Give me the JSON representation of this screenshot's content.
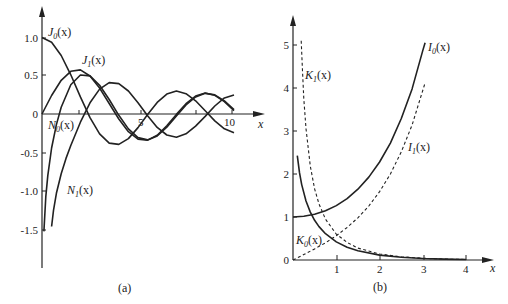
{
  "chart_data": [
    {
      "panel": "a",
      "type": "line",
      "caption": "(a)",
      "title": "",
      "xlabel": "x",
      "ylabel": "",
      "xlim": [
        0,
        10.5
      ],
      "ylim": [
        -1.7,
        1.2
      ],
      "x_ticks": [
        5,
        10
      ],
      "x_tick_labels": [
        "5",
        "10"
      ],
      "y_ticks": [
        1.0,
        0.5,
        0,
        -0.5,
        -1.0,
        -1.5
      ],
      "y_tick_labels": [
        "1.0",
        "0.5",
        "0",
        "-0.5",
        "-1.0",
        "-1.5"
      ],
      "grid": false,
      "legend": "inline labels",
      "series": [
        {
          "name": "J0(x)",
          "label_main": "J",
          "label_sub": "0",
          "style": "solid",
          "x": [
            0,
            0.5,
            1,
            1.5,
            2,
            2.5,
            3,
            3.5,
            4,
            4.5,
            5,
            5.5,
            6,
            6.5,
            7,
            7.5,
            8,
            8.5,
            9,
            9.5,
            10
          ],
          "values": [
            1.0,
            0.938,
            0.765,
            0.512,
            0.224,
            -0.048,
            -0.26,
            -0.38,
            -0.397,
            -0.321,
            -0.178,
            -0.007,
            0.151,
            0.26,
            0.3,
            0.266,
            0.172,
            0.042,
            -0.09,
            -0.194,
            -0.246
          ]
        },
        {
          "name": "J1(x)",
          "label_main": "J",
          "label_sub": "1",
          "style": "solid",
          "x": [
            0,
            0.5,
            1,
            1.5,
            2,
            2.5,
            3,
            3.5,
            4,
            4.5,
            5,
            5.5,
            6,
            6.5,
            7,
            7.5,
            8,
            8.5,
            9,
            9.5,
            10
          ],
          "values": [
            0,
            0.242,
            0.44,
            0.558,
            0.577,
            0.497,
            0.339,
            0.137,
            -0.066,
            -0.231,
            -0.328,
            -0.341,
            -0.277,
            -0.154,
            -0.005,
            0.135,
            0.235,
            0.273,
            0.245,
            0.161,
            0.043
          ]
        },
        {
          "name": "N0(x)",
          "label_main": "N",
          "label_sub": "0",
          "style": "solid",
          "x": [
            0.1,
            0.2,
            0.3,
            0.5,
            0.75,
            1,
            1.5,
            2,
            2.5,
            3,
            3.5,
            4,
            4.5,
            5,
            5.5,
            6,
            6.5,
            7,
            7.5,
            8,
            8.5,
            9,
            9.5,
            10
          ],
          "values": [
            -1.534,
            -1.081,
            -0.807,
            -0.445,
            -0.138,
            0.088,
            0.382,
            0.51,
            0.498,
            0.377,
            0.189,
            -0.017,
            -0.195,
            -0.309,
            -0.339,
            -0.288,
            -0.173,
            -0.026,
            0.117,
            0.224,
            0.27,
            0.25,
            0.171,
            0.056
          ]
        },
        {
          "name": "N1(x)",
          "label_main": "N",
          "label_sub": "1",
          "style": "solid",
          "x": [
            0.5,
            0.6,
            0.75,
            1,
            1.25,
            1.5,
            2,
            2.5,
            3,
            3.5,
            4,
            4.5,
            5,
            5.5,
            6,
            6.5,
            7,
            7.5,
            8,
            8.5,
            9,
            9.5,
            10
          ],
          "values": [
            -1.471,
            -1.26,
            -1.037,
            -0.781,
            -0.58,
            -0.412,
            -0.107,
            0.146,
            0.325,
            0.41,
            0.398,
            0.301,
            0.148,
            -0.024,
            -0.175,
            -0.274,
            -0.303,
            -0.259,
            -0.158,
            -0.032,
            0.104,
            0.21,
            0.249
          ]
        }
      ]
    },
    {
      "panel": "b",
      "type": "line",
      "caption": "(b)",
      "title": "",
      "xlabel": "x",
      "ylabel": "",
      "xlim": [
        0,
        4.4
      ],
      "ylim": [
        0,
        5.3
      ],
      "x_ticks": [
        1,
        2,
        3,
        4
      ],
      "x_tick_labels": [
        "1",
        "2",
        "3",
        "4"
      ],
      "y_ticks": [
        0,
        1,
        2,
        3,
        4,
        5
      ],
      "y_tick_labels": [
        "0",
        "1",
        "2",
        "3",
        "4",
        "5"
      ],
      "grid": false,
      "legend": "inline labels",
      "series": [
        {
          "name": "I0(x)",
          "label_main": "I",
          "label_sub": "0",
          "style": "solid",
          "x": [
            0,
            0.25,
            0.5,
            0.75,
            1,
            1.25,
            1.5,
            1.75,
            2,
            2.25,
            2.5,
            2.75,
            3,
            3.05
          ],
          "values": [
            1.0,
            1.016,
            1.063,
            1.146,
            1.266,
            1.429,
            1.647,
            1.928,
            2.28,
            2.718,
            3.29,
            3.98,
            4.881,
            5.05
          ]
        },
        {
          "name": "I1(x)",
          "label_main": "I",
          "label_sub": "1",
          "style": "dashed",
          "x": [
            0,
            0.25,
            0.5,
            0.75,
            1,
            1.25,
            1.5,
            1.75,
            2,
            2.25,
            2.5,
            2.75,
            3,
            3.05
          ],
          "values": [
            0,
            0.126,
            0.258,
            0.401,
            0.565,
            0.755,
            0.982,
            1.256,
            1.591,
            2.0,
            2.517,
            3.14,
            3.953,
            4.12
          ]
        },
        {
          "name": "K0(x)",
          "label_main": "K",
          "label_sub": "0",
          "style": "solid",
          "x": [
            0.1,
            0.15,
            0.2,
            0.3,
            0.4,
            0.5,
            0.6,
            0.75,
            1,
            1.25,
            1.5,
            2,
            2.5,
            3,
            3.5,
            4
          ],
          "values": [
            2.427,
            2.03,
            1.753,
            1.372,
            1.115,
            0.924,
            0.777,
            0.611,
            0.421,
            0.296,
            0.214,
            0.114,
            0.062,
            0.035,
            0.02,
            0.011
          ]
        },
        {
          "name": "K1(x)",
          "label_main": "K",
          "label_sub": "1",
          "style": "dashed",
          "x": [
            0.19,
            0.22,
            0.25,
            0.3,
            0.4,
            0.5,
            0.6,
            0.75,
            1,
            1.25,
            1.5,
            2,
            2.5,
            3,
            3.5,
            4
          ],
          "values": [
            5.1,
            4.4,
            3.75,
            3.056,
            2.184,
            1.656,
            1.303,
            0.949,
            0.602,
            0.41,
            0.277,
            0.14,
            0.074,
            0.04,
            0.022,
            0.012
          ]
        }
      ]
    }
  ],
  "panel_a": {
    "caption": "(a)",
    "x_axis_label": "x",
    "x_ticks": [
      "5",
      "10"
    ],
    "y_ticks": [
      "1.0",
      "0.5",
      "0",
      "-0.5",
      "-1.0",
      "-1.5"
    ],
    "labels": {
      "J0": {
        "main": "J",
        "sub": "0",
        "arg": "(x)"
      },
      "J1": {
        "main": "J",
        "sub": "1",
        "arg": "(x)"
      },
      "N0": {
        "main": "N",
        "sub": "0",
        "arg": "(x)"
      },
      "N1": {
        "main": "N",
        "sub": "1",
        "arg": "(x)"
      }
    }
  },
  "panel_b": {
    "caption": "(b)",
    "x_axis_label": "x",
    "x_ticks": [
      "1",
      "2",
      "3",
      "4"
    ],
    "y_ticks": [
      "0",
      "1",
      "2",
      "3",
      "4",
      "5"
    ],
    "labels": {
      "I0": {
        "main": "I",
        "sub": "0",
        "arg": "(x)"
      },
      "I1": {
        "main": "I",
        "sub": "1",
        "arg": "(x)"
      },
      "K0": {
        "main": "K",
        "sub": "0",
        "arg": "(x)"
      },
      "K1": {
        "main": "K",
        "sub": "1",
        "arg": "(x)"
      }
    }
  },
  "colors": {
    "ink": "#222222",
    "background": "#ffffff"
  }
}
